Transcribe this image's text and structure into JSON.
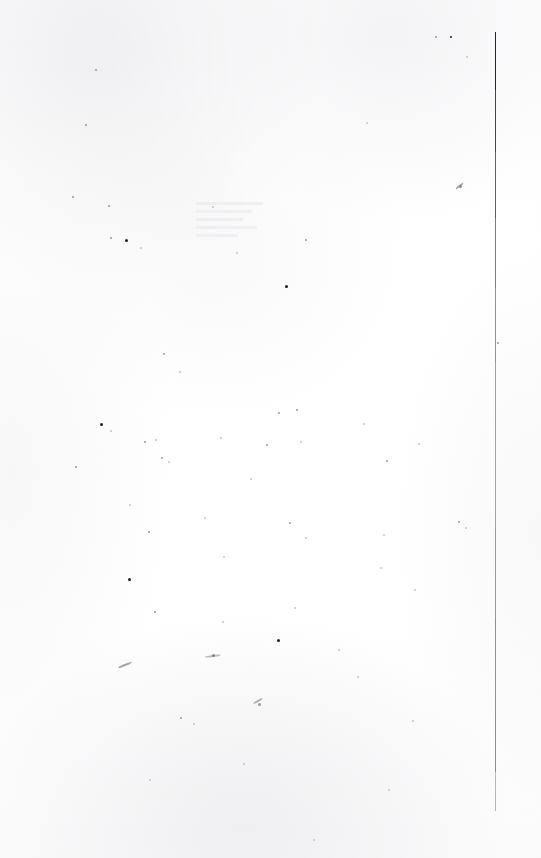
{
  "document": {
    "kind": "scanned-page",
    "page_state": "blank",
    "visible_text": "",
    "width_px": 541,
    "height_px": 858,
    "background_color": "#ffffff",
    "paper_tone_color": "#fbfbfc"
  },
  "margin_rule": {
    "name": "vertical-margin-rule",
    "orientation": "vertical",
    "x_px": 495,
    "top_px": 32,
    "bottom_px": 811,
    "thickness_px": 1,
    "segments": [
      {
        "top": 32,
        "height": 58,
        "color": "#1a1a1a",
        "opacity": 0.95
      },
      {
        "top": 90,
        "height": 62,
        "color": "#2b2b2b",
        "opacity": 0.88
      },
      {
        "top": 152,
        "height": 66,
        "color": "#3d3d3d",
        "opacity": 0.82
      },
      {
        "top": 218,
        "height": 70,
        "color": "#565656",
        "opacity": 0.78
      },
      {
        "top": 288,
        "height": 74,
        "color": "#6d6d6d",
        "opacity": 0.74
      },
      {
        "top": 362,
        "height": 80,
        "color": "#7c7c7c",
        "opacity": 0.72
      },
      {
        "top": 442,
        "height": 86,
        "color": "#828282",
        "opacity": 0.72
      },
      {
        "top": 528,
        "height": 90,
        "color": "#7a7a7a",
        "opacity": 0.74
      },
      {
        "top": 618,
        "height": 94,
        "color": "#707070",
        "opacity": 0.76
      },
      {
        "top": 712,
        "height": 60,
        "color": "#6a6a6a",
        "opacity": 0.76
      },
      {
        "top": 772,
        "height": 39,
        "color": "#8e8e8e",
        "opacity": 0.62
      }
    ]
  },
  "speckles": [
    {
      "x": 95,
      "y": 69,
      "size": 2,
      "tone": "soft"
    },
    {
      "x": 85,
      "y": 124,
      "size": 2,
      "tone": "soft"
    },
    {
      "x": 366,
      "y": 122,
      "size": 2,
      "tone": "faint"
    },
    {
      "x": 435,
      "y": 36,
      "size": 2,
      "tone": "soft"
    },
    {
      "x": 450,
      "y": 36,
      "size": 2,
      "tone": "dark"
    },
    {
      "x": 466,
      "y": 56,
      "size": 2,
      "tone": "faint"
    },
    {
      "x": 72,
      "y": 196,
      "size": 2,
      "tone": "soft"
    },
    {
      "x": 108,
      "y": 205,
      "size": 2,
      "tone": "soft"
    },
    {
      "x": 110,
      "y": 237,
      "size": 2,
      "tone": "soft"
    },
    {
      "x": 125,
      "y": 239,
      "size": 3,
      "tone": "dark"
    },
    {
      "x": 140,
      "y": 247,
      "size": 2,
      "tone": "faint"
    },
    {
      "x": 305,
      "y": 239,
      "size": 2,
      "tone": "soft"
    },
    {
      "x": 459,
      "y": 185,
      "size": 3,
      "tone": "soft"
    },
    {
      "x": 285,
      "y": 285,
      "size": 3,
      "tone": "dark"
    },
    {
      "x": 163,
      "y": 353,
      "size": 2,
      "tone": "soft"
    },
    {
      "x": 497,
      "y": 342,
      "size": 2,
      "tone": "soft"
    },
    {
      "x": 179,
      "y": 371,
      "size": 2,
      "tone": "faint"
    },
    {
      "x": 278,
      "y": 412,
      "size": 2,
      "tone": "soft"
    },
    {
      "x": 296,
      "y": 409,
      "size": 2,
      "tone": "soft"
    },
    {
      "x": 100,
      "y": 423,
      "size": 3,
      "tone": "dark"
    },
    {
      "x": 110,
      "y": 430,
      "size": 2,
      "tone": "faint"
    },
    {
      "x": 144,
      "y": 441,
      "size": 2,
      "tone": "soft"
    },
    {
      "x": 155,
      "y": 439,
      "size": 2,
      "tone": "faint"
    },
    {
      "x": 220,
      "y": 437,
      "size": 2,
      "tone": "faint"
    },
    {
      "x": 266,
      "y": 444,
      "size": 2,
      "tone": "soft"
    },
    {
      "x": 300,
      "y": 441,
      "size": 2,
      "tone": "faint"
    },
    {
      "x": 363,
      "y": 423,
      "size": 2,
      "tone": "faint"
    },
    {
      "x": 418,
      "y": 443,
      "size": 2,
      "tone": "faint"
    },
    {
      "x": 75,
      "y": 466,
      "size": 2,
      "tone": "soft"
    },
    {
      "x": 161,
      "y": 457,
      "size": 2,
      "tone": "soft"
    },
    {
      "x": 168,
      "y": 461,
      "size": 2,
      "tone": "faint"
    },
    {
      "x": 250,
      "y": 478,
      "size": 2,
      "tone": "faint"
    },
    {
      "x": 386,
      "y": 460,
      "size": 2,
      "tone": "soft"
    },
    {
      "x": 129,
      "y": 504,
      "size": 2,
      "tone": "faint"
    },
    {
      "x": 148,
      "y": 531,
      "size": 2,
      "tone": "soft"
    },
    {
      "x": 204,
      "y": 517,
      "size": 2,
      "tone": "faint"
    },
    {
      "x": 289,
      "y": 522,
      "size": 2,
      "tone": "soft"
    },
    {
      "x": 305,
      "y": 537,
      "size": 2,
      "tone": "faint"
    },
    {
      "x": 383,
      "y": 534,
      "size": 2,
      "tone": "faint"
    },
    {
      "x": 458,
      "y": 521,
      "size": 2,
      "tone": "soft"
    },
    {
      "x": 465,
      "y": 527,
      "size": 2,
      "tone": "faint"
    },
    {
      "x": 128,
      "y": 578,
      "size": 3,
      "tone": "dark"
    },
    {
      "x": 223,
      "y": 556,
      "size": 2,
      "tone": "faint"
    },
    {
      "x": 380,
      "y": 567,
      "size": 2,
      "tone": "faint"
    },
    {
      "x": 414,
      "y": 589,
      "size": 2,
      "tone": "faint"
    },
    {
      "x": 154,
      "y": 611,
      "size": 2,
      "tone": "soft"
    },
    {
      "x": 222,
      "y": 621,
      "size": 2,
      "tone": "faint"
    },
    {
      "x": 294,
      "y": 607,
      "size": 2,
      "tone": "faint"
    },
    {
      "x": 338,
      "y": 649,
      "size": 2,
      "tone": "faint"
    },
    {
      "x": 277,
      "y": 639,
      "size": 3,
      "tone": "dark"
    },
    {
      "x": 212,
      "y": 654,
      "size": 3,
      "tone": "soft"
    },
    {
      "x": 357,
      "y": 676,
      "size": 2,
      "tone": "faint"
    },
    {
      "x": 258,
      "y": 703,
      "size": 3,
      "tone": "soft"
    },
    {
      "x": 180,
      "y": 717,
      "size": 2,
      "tone": "soft"
    },
    {
      "x": 193,
      "y": 723,
      "size": 2,
      "tone": "faint"
    },
    {
      "x": 412,
      "y": 720,
      "size": 2,
      "tone": "faint"
    },
    {
      "x": 149,
      "y": 779,
      "size": 2,
      "tone": "faint"
    },
    {
      "x": 243,
      "y": 763,
      "size": 2,
      "tone": "faint"
    },
    {
      "x": 388,
      "y": 789,
      "size": 2,
      "tone": "faint"
    },
    {
      "x": 313,
      "y": 839,
      "size": 2,
      "tone": "faint"
    },
    {
      "x": 212,
      "y": 206,
      "size": 2,
      "tone": "faint"
    },
    {
      "x": 236,
      "y": 252,
      "size": 2,
      "tone": "faint"
    }
  ],
  "stroke_marks": [
    {
      "x": 118,
      "y": 664,
      "width": 14,
      "height": 2,
      "rotate": -22,
      "opacity": 0.55
    },
    {
      "x": 205,
      "y": 655,
      "width": 16,
      "height": 2,
      "rotate": -8,
      "opacity": 0.4
    },
    {
      "x": 455,
      "y": 185,
      "width": 9,
      "height": 2,
      "rotate": -38,
      "opacity": 0.55
    },
    {
      "x": 253,
      "y": 700,
      "width": 10,
      "height": 2,
      "rotate": -30,
      "opacity": 0.5
    }
  ],
  "bleed_through": {
    "x": 196,
    "y": 202,
    "width": 78,
    "line_widths": [
      "86%",
      "72%",
      "60%",
      "78%",
      "54%"
    ]
  }
}
